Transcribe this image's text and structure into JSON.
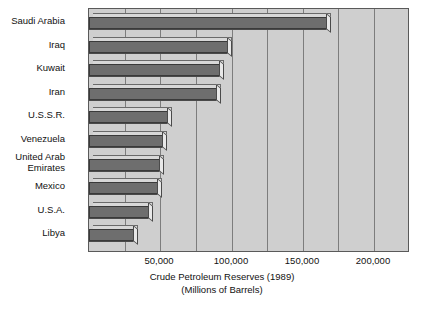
{
  "chart_data": {
    "type": "bar",
    "orientation": "horizontal",
    "title": "",
    "xlabel": "Crude Petroleum Reserves (1989)",
    "xlabel_sub": "(Millions of Barrels)",
    "ylabel": "",
    "categories": [
      "Saudi Arabia",
      "Iraq",
      "Kuwait",
      "Iran",
      "U.S.S.R.",
      "Venezuela",
      "United Arab\nEmirates",
      "Mexico",
      "U.S.A.",
      "Libya"
    ],
    "values": [
      170000,
      100000,
      95000,
      92500,
      58500,
      55000,
      52500,
      51500,
      45000,
      34500
    ],
    "tick_labels": [
      "50,000",
      "100,000",
      "150,000",
      "200,000"
    ],
    "tick_values": [
      50000,
      100000,
      150000,
      200000
    ],
    "xlim": [
      0,
      200000
    ],
    "grid": true,
    "legend": "none",
    "colors": {
      "plot_background": "#cfcfcf",
      "bar_face": "#6e6e6e",
      "bar_top": "#d8d8d8",
      "bar_cap": "#e8e8e8",
      "gridline": "#7d7d7d",
      "frame": "#5a5a5a",
      "text": "#111111",
      "page_background": "#ffffff"
    }
  }
}
